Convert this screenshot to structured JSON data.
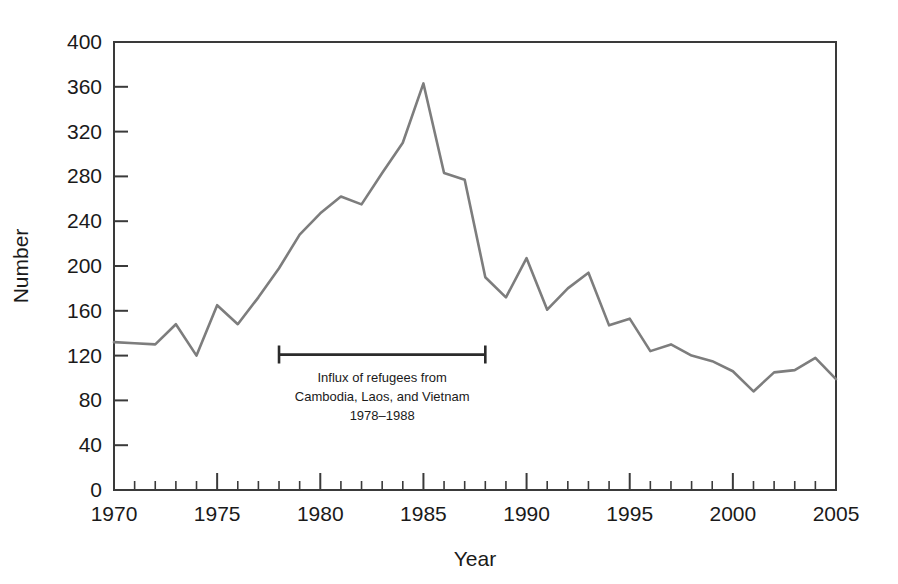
{
  "chart_data": {
    "type": "line",
    "title": "",
    "xlabel": "Year",
    "ylabel": "Number",
    "xlim": [
      1970,
      2005
    ],
    "ylim": [
      0,
      400
    ],
    "grid": false,
    "legend": null,
    "x_tick_labels": [
      "1970",
      "1975",
      "1980",
      "1985",
      "1990",
      "1995",
      "2000",
      "2005"
    ],
    "x_tick_values": [
      1970,
      1975,
      1980,
      1985,
      1990,
      1995,
      2000,
      2005
    ],
    "x_minor_tick_step": 1,
    "y_tick_labels": [
      "0",
      "40",
      "80",
      "120",
      "160",
      "200",
      "240",
      "280",
      "320",
      "360",
      "400"
    ],
    "y_tick_values": [
      0,
      40,
      80,
      120,
      160,
      200,
      240,
      280,
      320,
      360,
      400
    ],
    "line_color": "#7d7d7d",
    "axis_color": "#3a3a3a",
    "annotation_color": "#2b2b2b",
    "x": [
      1970,
      1971,
      1972,
      1973,
      1974,
      1975,
      1976,
      1977,
      1978,
      1979,
      1980,
      1981,
      1982,
      1983,
      1984,
      1985,
      1986,
      1987,
      1988,
      1989,
      1990,
      1991,
      1992,
      1993,
      1994,
      1995,
      1996,
      1997,
      1998,
      1999,
      2000,
      2001,
      2002,
      2003,
      2004,
      2005
    ],
    "values": [
      132,
      131,
      130,
      148,
      120,
      165,
      148,
      172,
      198,
      228,
      247,
      262,
      255,
      283,
      310,
      363,
      283,
      277,
      190,
      172,
      207,
      161,
      180,
      194,
      147,
      153,
      124,
      130,
      120,
      115,
      106,
      88,
      105,
      107,
      118,
      99
    ],
    "annotations": [
      {
        "name": "refugee-influx-bracket",
        "x_start": 1978,
        "x_end": 1988,
        "y": 120,
        "lines": [
          "Influx of refugees from",
          "Cambodia, Laos, and Vietnam",
          "1978–1988"
        ]
      }
    ]
  },
  "axes": {
    "x_axis_title": "Year",
    "y_axis_title": "Number"
  }
}
